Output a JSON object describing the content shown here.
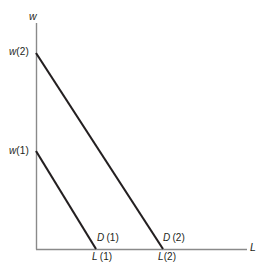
{
  "figure": {
    "title": "",
    "background_color": "#ffffff",
    "axis_color": "#8a8a8a",
    "curve_color": "#231f20",
    "axes": {
      "y_axis_label": "w",
      "x_axis_label": "L"
    },
    "labels": {
      "w2": {
        "var": "w",
        "index": "(2)"
      },
      "w1": {
        "var": "w",
        "index": "(1)"
      },
      "D1": {
        "var": "D",
        "index": "(1)"
      },
      "D2": {
        "var": "D",
        "index": "(2)"
      },
      "L1": {
        "var": "L",
        "index": "(1)"
      },
      "L2": {
        "var": "L",
        "index": "(2)"
      }
    }
  },
  "chart_data": {
    "type": "line",
    "title": "",
    "xlabel": "L",
    "ylabel": "w",
    "grid": false,
    "legend": null,
    "xlim": [
      0,
      1
    ],
    "ylim": [
      0,
      1
    ],
    "axis_origin_px": {
      "x": 36,
      "y": 249
    },
    "axis_extent_px": {
      "y_axis_top": 23,
      "x_axis_right": 247
    },
    "series": [
      {
        "name": "D(1)",
        "label": "D (1)",
        "description": "Lower labour demand curve: downward sloping straight line from wage intercept w(1) to employment intercept L(1)",
        "points_px": [
          [
            36,
            151
          ],
          [
            96,
            249
          ]
        ],
        "y_intercept_label": "w(1)",
        "x_intercept_label": "L(1)"
      },
      {
        "name": "D(2)",
        "label": "D (2)",
        "description": "Upper labour demand curve: downward sloping straight line from wage intercept w(2) to employment intercept L(2)",
        "points_px": [
          [
            36,
            53
          ],
          [
            163,
            249
          ]
        ],
        "y_intercept_label": "w(2)",
        "x_intercept_label": "L(2)"
      }
    ],
    "annotations": [
      {
        "text": "w",
        "role": "y-axis-name",
        "px": [
          29,
          11
        ]
      },
      {
        "text": "L",
        "role": "x-axis-name",
        "px": [
          250,
          242
        ]
      },
      {
        "text": "w(2)",
        "role": "y-intercept-tick",
        "px": [
          9,
          47
        ]
      },
      {
        "text": "w(1)",
        "role": "y-intercept-tick",
        "px": [
          9,
          146
        ]
      },
      {
        "text": "D (1)",
        "role": "curve-name",
        "px": [
          97,
          233
        ]
      },
      {
        "text": "D (2)",
        "role": "curve-name",
        "px": [
          163,
          233
        ]
      },
      {
        "text": "L (1)",
        "role": "x-intercept-tick",
        "px": [
          92,
          252
        ]
      },
      {
        "text": "L (2)",
        "role": "x-intercept-tick",
        "px": [
          158,
          252
        ]
      }
    ]
  }
}
